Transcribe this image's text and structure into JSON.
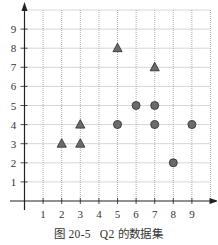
{
  "caption": {
    "figure_number": "图 20-5",
    "title": "Q2 的数据集"
  },
  "colors": {
    "marker_fill": "#6b6b6b",
    "marker_stroke": "#2a2a2a",
    "grid": "#9a9a9a",
    "axis": "#222222"
  },
  "chart_data": {
    "type": "scatter",
    "xlabel": "",
    "ylabel": "",
    "xlim": [
      0,
      10
    ],
    "ylim": [
      0,
      10
    ],
    "x_ticks": [
      1,
      2,
      3,
      4,
      5,
      6,
      7,
      8,
      9
    ],
    "y_ticks": [
      1,
      2,
      3,
      4,
      5,
      6,
      7,
      8,
      9
    ],
    "grid": true,
    "grid_style": "dotted",
    "legend": null,
    "series": [
      {
        "name": "triangles",
        "marker": "triangle",
        "points": [
          [
            2,
            3
          ],
          [
            3,
            3
          ],
          [
            3,
            4
          ],
          [
            5,
            8
          ],
          [
            7,
            7
          ]
        ]
      },
      {
        "name": "circles",
        "marker": "circle",
        "points": [
          [
            5,
            4
          ],
          [
            6,
            5
          ],
          [
            7,
            5
          ],
          [
            7,
            4
          ],
          [
            9,
            4
          ],
          [
            8,
            2
          ]
        ]
      }
    ]
  }
}
